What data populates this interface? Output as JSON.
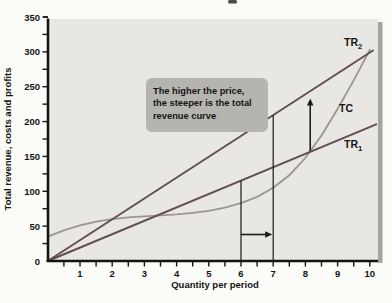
{
  "chart_data": {
    "type": "line",
    "title": "",
    "xlabel": "Quantity per period",
    "ylabel": "Total revenue, costs and profits",
    "xlim": [
      0,
      10.3
    ],
    "ylim": [
      0,
      350
    ],
    "grid": "off",
    "legend": "none (curves labeled inline at right)",
    "x_tick_labels": [
      "1",
      "2",
      "3",
      "4",
      "5",
      "6",
      "7",
      "8",
      "9",
      "10"
    ],
    "x_tick_values": [
      1,
      2,
      3,
      4,
      5,
      6,
      7,
      8,
      9,
      10
    ],
    "x_minor_step": 0.5,
    "y_tick_labels": [
      "0",
      "50",
      "100",
      "150",
      "200",
      "250",
      "300",
      "350"
    ],
    "y_tick_values": [
      0,
      50,
      100,
      150,
      200,
      250,
      300,
      350
    ],
    "y_minor_step": 25,
    "colors": {
      "revenue_line": "#63504e",
      "cost_line": "#9c968e",
      "axis": "#141414",
      "guides_arrows": "#1a1a1a",
      "panel_bg": "#e8e7e3",
      "panel_shadow": "#8e8e8c",
      "annotation_bg": "#b5b4b0",
      "annotation_text": "#141414",
      "page_bg": "#fbfbf8"
    },
    "series": [
      {
        "name": "TC",
        "label": "TC",
        "label_sub": "",
        "kind": "cost-curve",
        "points": [
          [
            0,
            35
          ],
          [
            0.5,
            44
          ],
          [
            1,
            51
          ],
          [
            1.5,
            56.5
          ],
          [
            2,
            60
          ],
          [
            2.5,
            62.5
          ],
          [
            3,
            64
          ],
          [
            3.5,
            65.5
          ],
          [
            4,
            67
          ],
          [
            4.5,
            69
          ],
          [
            5,
            72
          ],
          [
            5.5,
            76.5
          ],
          [
            6,
            83
          ],
          [
            6.5,
            92
          ],
          [
            7,
            105
          ],
          [
            7.5,
            123
          ],
          [
            8,
            148
          ],
          [
            8.5,
            180
          ],
          [
            9,
            218
          ],
          [
            9.5,
            259
          ],
          [
            10,
            303
          ]
        ]
      },
      {
        "name": "TR1",
        "label": "TR",
        "label_sub": "1",
        "kind": "revenue-line",
        "points": [
          [
            0,
            0
          ],
          [
            10.2,
            196
          ]
        ]
      },
      {
        "name": "TR2",
        "label": "TR",
        "label_sub": "2",
        "kind": "revenue-line",
        "points": [
          [
            0,
            0
          ],
          [
            10.1,
            302
          ]
        ]
      }
    ],
    "guides": [
      {
        "name": "quantity-6-line",
        "x": 6,
        "y_top": 115
      },
      {
        "name": "quantity-7-line",
        "x": 7,
        "y_top": 209
      }
    ],
    "arrows": [
      {
        "name": "quantity-increase-arrow",
        "dir": "right",
        "y": 38,
        "x_from": 6,
        "x_to": 7
      },
      {
        "name": "revenue-increase-arrow",
        "dir": "up",
        "x": 8.15,
        "y_from": 158,
        "y_to": 233
      }
    ],
    "annotation": {
      "text_lines": [
        "The higher the price,",
        "the steeper is the total",
        "revenue curve"
      ]
    }
  }
}
